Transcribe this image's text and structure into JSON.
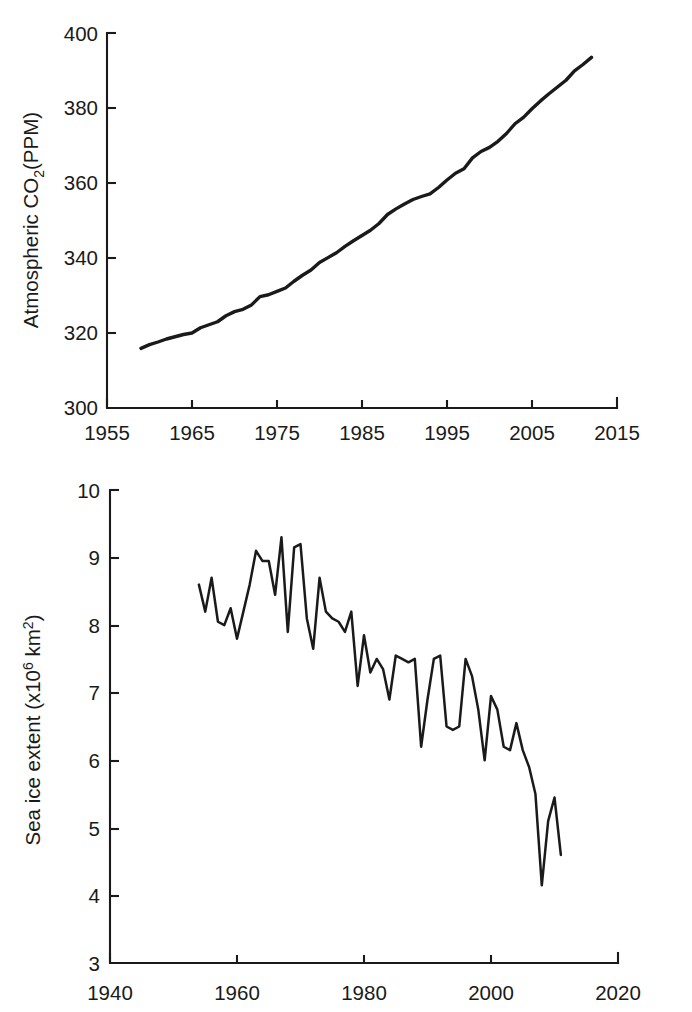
{
  "figure": {
    "background": "#ffffff",
    "line_color": "#1a1a1a",
    "panels": [
      "co2",
      "sea_ice"
    ]
  },
  "chart_data": [
    {
      "type": "line",
      "id": "co2",
      "title": "",
      "xlabel": "",
      "ylabel": "Atmospheric CO2(PPM)",
      "ylabel_parts": {
        "pre": "Atmospheric CO",
        "sub": "2",
        "post": "(PPM)"
      },
      "xlim": [
        1955,
        2015
      ],
      "ylim": [
        300,
        400
      ],
      "xticks": [
        1955,
        1965,
        1975,
        1985,
        1995,
        2005,
        2015
      ],
      "yticks": [
        300,
        320,
        340,
        360,
        380,
        400
      ],
      "grid": false,
      "legend": "none",
      "series": [
        {
          "name": "Atmospheric CO2",
          "x": [
            1959,
            1960,
            1961,
            1962,
            1963,
            1964,
            1965,
            1966,
            1967,
            1968,
            1969,
            1970,
            1971,
            1972,
            1973,
            1974,
            1975,
            1976,
            1977,
            1978,
            1979,
            1980,
            1981,
            1982,
            1983,
            1984,
            1985,
            1986,
            1987,
            1988,
            1989,
            1990,
            1991,
            1992,
            1993,
            1994,
            1995,
            1996,
            1997,
            1998,
            1999,
            2000,
            2001,
            2002,
            2003,
            2004,
            2005,
            2006,
            2007,
            2008,
            2009,
            2010,
            2011,
            2012
          ],
          "values": [
            315.9,
            316.9,
            317.6,
            318.4,
            319.0,
            319.6,
            320.0,
            321.4,
            322.2,
            323.0,
            324.6,
            325.7,
            326.3,
            327.5,
            329.7,
            330.2,
            331.1,
            332.0,
            333.8,
            335.4,
            336.8,
            338.8,
            340.1,
            341.4,
            343.1,
            344.6,
            346.0,
            347.4,
            349.2,
            351.6,
            353.1,
            354.4,
            355.6,
            356.4,
            357.1,
            358.8,
            360.8,
            362.6,
            363.8,
            366.7,
            368.4,
            369.5,
            371.1,
            373.2,
            375.8,
            377.5,
            379.8,
            381.9,
            383.8,
            385.6,
            387.4,
            389.9,
            391.6,
            393.5
          ]
        }
      ]
    },
    {
      "type": "line",
      "id": "sea_ice",
      "title": "",
      "xlabel": "",
      "ylabel": "Sea ice extent (x106 km2)",
      "ylabel_parts": {
        "pre": "Sea ice extent (x10",
        "sup1": "6",
        "mid": " km",
        "sup2": "2",
        "post": ")"
      },
      "xlim": [
        1940,
        2020
      ],
      "ylim": [
        3,
        10
      ],
      "xticks": [
        1940,
        1960,
        1980,
        2000,
        2020
      ],
      "yticks": [
        3,
        4,
        5,
        6,
        7,
        8,
        9,
        10
      ],
      "grid": false,
      "legend": "none",
      "series": [
        {
          "name": "Sea ice extent",
          "x": [
            1954,
            1955,
            1956,
            1957,
            1958,
            1959,
            1960,
            1961,
            1962,
            1963,
            1964,
            1965,
            1966,
            1967,
            1968,
            1969,
            1970,
            1971,
            1972,
            1973,
            1974,
            1975,
            1976,
            1977,
            1978,
            1979,
            1980,
            1981,
            1982,
            1983,
            1984,
            1985,
            1986,
            1987,
            1988,
            1989,
            1990,
            1991,
            1992,
            1993,
            1994,
            1995,
            1996,
            1997,
            1998,
            1999,
            2000,
            2001,
            2002,
            2003,
            2004,
            2005,
            2006,
            2007,
            2008,
            2009,
            2010,
            2011
          ],
          "values": [
            8.6,
            8.2,
            8.7,
            8.05,
            8.0,
            8.25,
            7.8,
            8.2,
            8.6,
            9.1,
            8.95,
            8.95,
            8.45,
            9.3,
            7.9,
            9.15,
            9.2,
            8.1,
            7.65,
            8.7,
            8.2,
            8.1,
            8.05,
            7.9,
            8.2,
            7.1,
            7.85,
            7.3,
            7.5,
            7.35,
            6.9,
            7.55,
            7.5,
            7.45,
            7.5,
            6.2,
            6.9,
            7.5,
            7.55,
            6.5,
            6.45,
            6.5,
            7.5,
            7.25,
            6.75,
            6.0,
            6.95,
            6.75,
            6.2,
            6.15,
            6.55,
            6.15,
            5.9,
            5.5,
            4.15,
            5.1,
            5.45,
            4.6
          ]
        }
      ]
    }
  ]
}
